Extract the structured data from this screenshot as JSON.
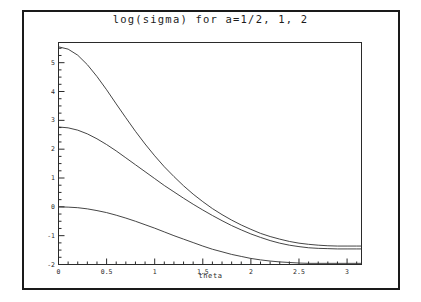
{
  "chart_data": {
    "type": "line",
    "title": "log(sigma) for a=1/2, 1, 2",
    "xlabel": "theta",
    "ylabel": "",
    "xlim": [
      0,
      3.15
    ],
    "ylim": [
      -2,
      5.7
    ],
    "grid": false,
    "legend_position": "none",
    "xticks": [
      "0",
      "0.5",
      "1",
      "1.5",
      "2",
      "2.5",
      "3"
    ],
    "xtick_values": [
      0,
      0.5,
      1,
      1.5,
      2,
      2.5,
      3
    ],
    "yticks": [
      "5",
      "4",
      "3",
      "2",
      "1",
      "0",
      "-1",
      "-2"
    ],
    "ytick_values": [
      5,
      4,
      3,
      2,
      1,
      0,
      -1,
      -2
    ],
    "x": [
      0,
      0.1,
      0.2,
      0.3,
      0.4,
      0.5,
      0.6,
      0.7,
      0.8,
      0.9,
      1.0,
      1.1,
      1.2,
      1.3,
      1.4,
      1.5,
      1.6,
      1.7,
      1.8,
      1.9,
      2.0,
      2.1,
      2.2,
      2.3,
      2.4,
      2.5,
      2.6,
      2.7,
      2.8,
      2.9,
      3.0,
      3.1,
      3.15
    ],
    "series": [
      {
        "name": "a=2",
        "style": "solid",
        "color": "#303030",
        "values": [
          5.55,
          5.47,
          5.26,
          4.93,
          4.52,
          4.06,
          3.57,
          3.09,
          2.62,
          2.18,
          1.77,
          1.39,
          1.05,
          0.73,
          0.44,
          0.18,
          -0.06,
          -0.27,
          -0.46,
          -0.63,
          -0.78,
          -0.92,
          -1.03,
          -1.12,
          -1.2,
          -1.26,
          -1.3,
          -1.33,
          -1.35,
          -1.36,
          -1.36,
          -1.36,
          -1.36
        ]
      },
      {
        "name": "a=1",
        "style": "solid",
        "color": "#303030",
        "values": [
          2.77,
          2.74,
          2.66,
          2.53,
          2.36,
          2.16,
          1.94,
          1.7,
          1.46,
          1.22,
          0.98,
          0.74,
          0.52,
          0.3,
          0.09,
          -0.11,
          -0.3,
          -0.48,
          -0.65,
          -0.8,
          -0.94,
          -1.06,
          -1.17,
          -1.26,
          -1.33,
          -1.38,
          -1.42,
          -1.44,
          -1.45,
          -1.46,
          -1.46,
          -1.46,
          -1.46
        ]
      },
      {
        "name": "a=1/2",
        "style": "solid",
        "color": "#303030",
        "values": [
          0.0,
          -0.01,
          -0.03,
          -0.07,
          -0.13,
          -0.2,
          -0.29,
          -0.39,
          -0.5,
          -0.62,
          -0.74,
          -0.87,
          -1.0,
          -1.12,
          -1.24,
          -1.36,
          -1.47,
          -1.56,
          -1.65,
          -1.72,
          -1.79,
          -1.84,
          -1.88,
          -1.91,
          -1.93,
          -1.95,
          -1.96,
          -1.96,
          -1.96,
          -1.96,
          -1.96,
          -1.96,
          -1.96
        ]
      }
    ]
  },
  "figure": {
    "background_color": "#ffffff",
    "frame_color": "#1a1a1a",
    "axis_color": "#2a2a2a"
  }
}
